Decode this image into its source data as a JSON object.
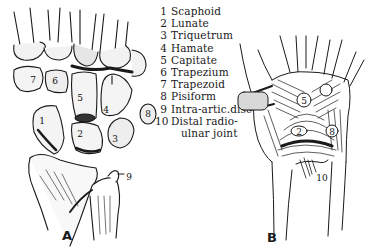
{
  "figure_a": {
    "caption": "A",
    "labels": [
      {
        "num": "1",
        "x": 42,
        "y": 120
      },
      {
        "num": "2",
        "x": 80,
        "y": 133
      },
      {
        "num": "3",
        "x": 115,
        "y": 138
      },
      {
        "num": "4",
        "x": 106,
        "y": 109
      },
      {
        "num": "5",
        "x": 80,
        "y": 97
      },
      {
        "num": "6",
        "x": 55,
        "y": 80
      },
      {
        "num": "7",
        "x": 33,
        "y": 79
      },
      {
        "num": "8",
        "x": 146,
        "y": 113
      },
      {
        "num": "9",
        "x": 127,
        "y": 179
      }
    ]
  },
  "figure_b": {
    "caption": "B",
    "labels": [
      {
        "num": "5",
        "x": 76,
        "y": 104
      },
      {
        "num": "2",
        "x": 71,
        "y": 134
      },
      {
        "num": "8",
        "x": 104,
        "y": 134
      },
      {
        "num": "10",
        "x": 88,
        "y": 179
      }
    ]
  },
  "legend": {
    "items": [
      {
        "num": "1",
        "label": "Scaphoid"
      },
      {
        "num": "2",
        "label": "Lunate"
      },
      {
        "num": "3",
        "label": "Triquetrum"
      },
      {
        "num": "4",
        "label": "Hamate"
      },
      {
        "num": "5",
        "label": "Capitate"
      },
      {
        "num": "6",
        "label": "Trapezium"
      },
      {
        "num": "7",
        "label": "Trapezoid"
      },
      {
        "num": "8",
        "label": "Pisiform"
      },
      {
        "num": "9",
        "label": "Intra-artic.disc"
      },
      {
        "num": "10",
        "label": "Distal radio-"
      }
    ],
    "continuation": "ulnar joint"
  },
  "colors": {
    "ink": "#1a1a1a",
    "paper": "#ffffff"
  }
}
